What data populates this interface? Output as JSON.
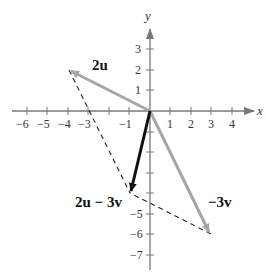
{
  "diagram": {
    "type": "vector-addition",
    "axes": {
      "x_label": "x",
      "y_label": "y",
      "x_ticks": [
        "−6",
        "−5",
        "−4",
        "−3",
        "−1",
        "1",
        "2",
        "3",
        "4"
      ],
      "y_ticks_positive": [
        "3",
        "2",
        "1"
      ],
      "y_ticks_negative": [
        "−5",
        "−6",
        "−7"
      ]
    },
    "vectors": [
      {
        "label": "2u",
        "from": [
          0,
          0
        ],
        "to": [
          -4,
          2
        ],
        "color": "#a6a6a6"
      },
      {
        "label": "−3v",
        "from": [
          0,
          0
        ],
        "to": [
          3,
          -6
        ],
        "color": "#a6a6a6"
      },
      {
        "label": "2u − 3v",
        "from": [
          0,
          0
        ],
        "to": [
          -1,
          -4
        ],
        "color": "#111111"
      }
    ],
    "dashed_lines": [
      {
        "from": [
          -4,
          2
        ],
        "to": [
          -1,
          -4
        ]
      },
      {
        "from": [
          3,
          -6
        ],
        "to": [
          -1,
          -4
        ]
      }
    ],
    "labels": {
      "vec_2u": "2u",
      "vec_neg3v": "−3v",
      "vec_sum": "2u − 3v"
    }
  }
}
